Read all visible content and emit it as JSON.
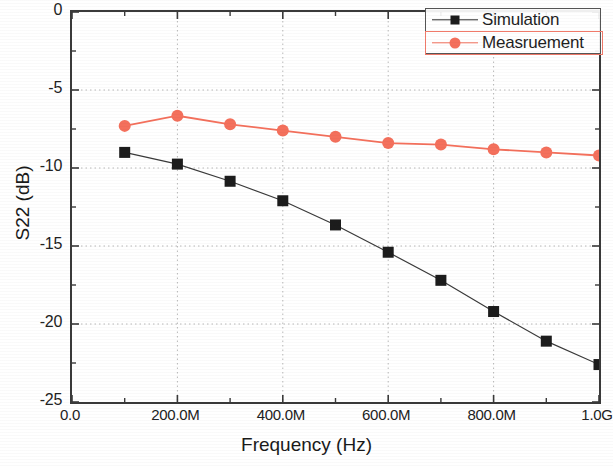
{
  "chart_data": {
    "type": "line",
    "title": "",
    "xlabel": "Frequency (Hz)",
    "ylabel": "S22 (dB)",
    "xlim": [
      0,
      1000000000
    ],
    "ylim": [
      -25,
      0
    ],
    "grid": true,
    "legend_position": "top-right",
    "x_tick_labels": [
      "0.0",
      "200.0M",
      "400.0M",
      "600.0M",
      "800.0M",
      "1.0G"
    ],
    "x_tick_values": [
      0,
      200000000,
      400000000,
      600000000,
      800000000,
      1000000000
    ],
    "y_tick_labels": [
      "0",
      "-5",
      "-10",
      "-15",
      "-20",
      "-25"
    ],
    "y_tick_values": [
      0,
      -5,
      -10,
      -15,
      -20,
      -25
    ],
    "x": [
      100000000,
      200000000,
      300000000,
      400000000,
      500000000,
      600000000,
      700000000,
      800000000,
      900000000,
      1000000000
    ],
    "series": [
      {
        "name": "Simulation",
        "marker": "square",
        "color": "#1c1c1c",
        "line_color": "#3a3a3a",
        "values": [
          -9.0,
          -9.75,
          -10.85,
          -12.1,
          -13.65,
          -15.4,
          -17.2,
          -19.2,
          -21.1,
          -22.6
        ]
      },
      {
        "name": "Measruement",
        "marker": "circle",
        "color": "#f4705c",
        "line_color": "#f4705c",
        "values": [
          -7.3,
          -6.65,
          -7.2,
          -7.6,
          -8.0,
          -8.4,
          -8.5,
          -8.8,
          -9.0,
          -9.2
        ]
      }
    ]
  },
  "legend": {
    "entries": [
      {
        "label": "Simulation"
      },
      {
        "label": "Measruement"
      }
    ]
  },
  "axes": {
    "x_title": "Frequency (Hz)",
    "y_title": "S22 (dB)"
  },
  "colors": {
    "simulation": "#1c1c1c",
    "measurement": "#f4705c",
    "axis": "#3a3a3a",
    "grid": "#b8b8b8",
    "background": "#ffffff"
  }
}
